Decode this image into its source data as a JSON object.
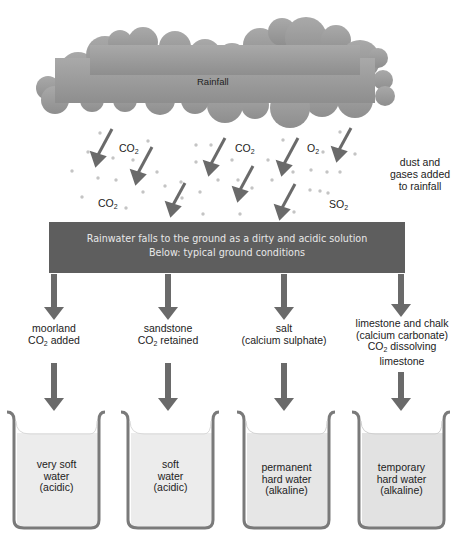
{
  "cloud": {
    "label": "Rainfall"
  },
  "gases": [
    {
      "formula": "CO",
      "sub": "2"
    },
    {
      "formula": "CO",
      "sub": "2"
    },
    {
      "formula": "O",
      "sub": "2"
    },
    {
      "formula": "CO",
      "sub": "2"
    },
    {
      "formula": "SO",
      "sub": "2"
    }
  ],
  "side_note": {
    "lines": [
      "dust and",
      "gases added",
      "to rainfall"
    ]
  },
  "banner": {
    "line1": "Rainwater falls to the ground as a dirty and acidic solution",
    "line2": "Below: typical ground conditions"
  },
  "ground_conditions": [
    {
      "lines": [
        "moorland",
        "CO|2| added"
      ],
      "l1": "moorland",
      "l2a": "CO",
      "l2sub": "2",
      "l2b": " added"
    },
    {
      "lines": [
        "sandstone",
        "CO|2| retained"
      ],
      "l1": "sandstone",
      "l2a": "CO",
      "l2sub": "2",
      "l2b": " retained"
    },
    {
      "lines": [
        "salt",
        "(calcium sulphate)"
      ],
      "l1": "salt",
      "l2": "(calcium sulphate)"
    },
    {
      "lines": [
        "limestone and chalk",
        "(calcium carbonate)",
        "CO|2| dissolving",
        "limestone"
      ],
      "l1": "limestone and chalk",
      "l2": "(calcium carbonate)",
      "l3a": "CO",
      "l3sub": "2",
      "l3b": " dissolving",
      "l4": "limestone"
    }
  ],
  "beakers": [
    {
      "lines": [
        "very soft",
        "water",
        "(acidic)"
      ],
      "l1": "very soft",
      "l2": "water",
      "l3": "(acidic)"
    },
    {
      "lines": [
        "soft",
        "water",
        "(acidic)"
      ],
      "l1": "soft",
      "l2": "water",
      "l3": "(acidic)"
    },
    {
      "lines": [
        "permanent",
        "hard water",
        "(alkaline)"
      ],
      "l1": "permanent",
      "l2": "hard water",
      "l3": "(alkaline)"
    },
    {
      "lines": [
        "temporary",
        "hard water",
        "(alkaline)"
      ],
      "l1": "temporary",
      "l2": "hard water",
      "l3": "(alkaline)"
    }
  ],
  "colors": {
    "cloud": "#9a9a9a",
    "arrow": "#6a6a6a",
    "banner": "#5e5e5e",
    "banner_text": "#e8e8e8",
    "beaker_outline": "#7a7a7a",
    "water": "#ececec"
  }
}
